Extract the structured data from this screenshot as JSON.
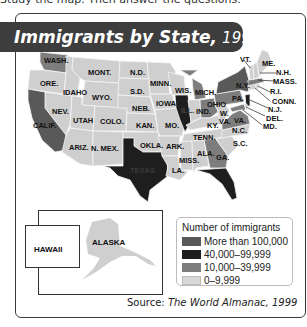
{
  "header": {
    "instruction_text": "Study the map. Then answer the questions."
  },
  "title": {
    "main": "Immigrants by State,",
    "year": "1996"
  },
  "colors": {
    "more_than_100000": "#595959",
    "40000_99999": "#1e1e1e",
    "10000_39999": "#7d7d7d",
    "0_9999": "#cfcfcf",
    "title_bg": "#3d3d3d"
  },
  "map": {
    "state_labels": [
      {
        "name": "WASH.",
        "category": "10,000–39,999"
      },
      {
        "name": "ORE.",
        "category": "0–9,999"
      },
      {
        "name": "IDAHO",
        "category": "0–9,999"
      },
      {
        "name": "MONT.",
        "category": "0–9,999"
      },
      {
        "name": "WYO.",
        "category": "0–9,999"
      },
      {
        "name": "NEV.",
        "category": "0–9,999"
      },
      {
        "name": "CALIF.",
        "category": "More than 100,000"
      },
      {
        "name": "UTAH",
        "category": "0–9,999"
      },
      {
        "name": "COLO.",
        "category": "0–9,999"
      },
      {
        "name": "ARIZ.",
        "category": "0–9,999"
      },
      {
        "name": "N. MEX.",
        "category": "0–9,999"
      },
      {
        "name": "N.D.",
        "category": "0–9,999"
      },
      {
        "name": "S.D.",
        "category": "0–9,999"
      },
      {
        "name": "NEB.",
        "category": "0–9,999"
      },
      {
        "name": "KAN.",
        "category": "0–9,999"
      },
      {
        "name": "OKLA.",
        "category": "0–9,999"
      },
      {
        "name": "TEXAS",
        "category": "40,000–99,999"
      },
      {
        "name": "MINN.",
        "category": "0–9,999"
      },
      {
        "name": "IOWA",
        "category": "0–9,999"
      },
      {
        "name": "MO.",
        "category": "0–9,999"
      },
      {
        "name": "ARK.",
        "category": "0–9,999"
      },
      {
        "name": "LA.",
        "category": "0–9,999"
      },
      {
        "name": "WIS.",
        "category": "0–9,999"
      },
      {
        "name": "ILL.",
        "category": "40,000–99,999"
      },
      {
        "name": "MICH.",
        "category": "10,000–39,999"
      },
      {
        "name": "IND.",
        "category": "0–9,999"
      },
      {
        "name": "OHIO",
        "category": "10,000–39,999"
      },
      {
        "name": "KY.",
        "category": "0–9,999"
      },
      {
        "name": "TENN.",
        "category": "0–9,999"
      },
      {
        "name": "MISS.",
        "category": "0–9,999"
      },
      {
        "name": "ALA.",
        "category": "0–9,999"
      },
      {
        "name": "GA.",
        "category": "10,000–39,999"
      },
      {
        "name": "FLA.",
        "category": "40,000–99,999"
      },
      {
        "name": "S.C.",
        "category": "0–9,999"
      },
      {
        "name": "N.C.",
        "category": "0–9,999"
      },
      {
        "name": "VA.",
        "category": "10,000–39,999"
      },
      {
        "name": "W. VA.",
        "category": "0–9,999"
      },
      {
        "name": "PA.",
        "category": "10,000–39,999"
      },
      {
        "name": "N.Y.",
        "category": "More than 100,000"
      },
      {
        "name": "VT.",
        "category": "0–9,999"
      },
      {
        "name": "ME.",
        "category": "0–9,999"
      },
      {
        "name": "N.H.",
        "category": "0–9,999"
      },
      {
        "name": "MASS.",
        "category": "10,000–39,999"
      },
      {
        "name": "R.I.",
        "category": "0–9,999"
      },
      {
        "name": "CONN.",
        "category": "0–9,999"
      },
      {
        "name": "N.J.",
        "category": "40,000–99,999"
      },
      {
        "name": "DEL.",
        "category": "0–9,999"
      },
      {
        "name": "MD.",
        "category": "10,000–39,999"
      }
    ],
    "inset_labels": {
      "hawaii": "HAWAII",
      "alaska": "ALASKA"
    }
  },
  "legend": {
    "title": "Number of immigrants",
    "items": [
      {
        "label": "More than 100,000",
        "color": "#595959"
      },
      {
        "label": "40,000–99,999",
        "color": "#1e1e1e"
      },
      {
        "label": "10,000–39,999",
        "color": "#7d7d7d"
      },
      {
        "label": "0–9,999",
        "color": "#cfcfcf"
      }
    ]
  },
  "source": {
    "prefix": "Source:",
    "citation": "The World Almanac, 1999"
  }
}
